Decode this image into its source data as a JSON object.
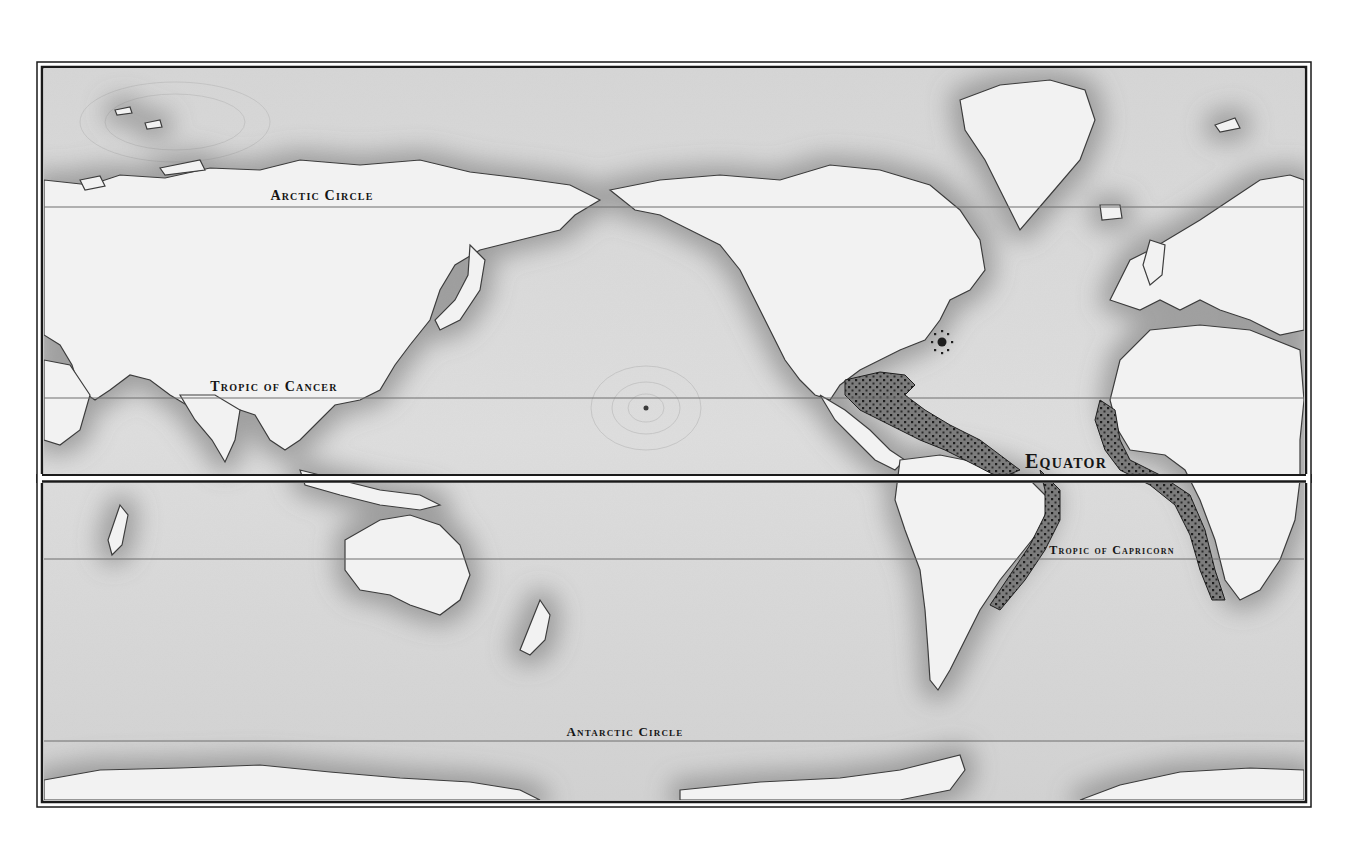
{
  "map": {
    "projection_style": "Pacific-centered world map, engraved relief style, grayscale",
    "colors": {
      "ocean": "#dcdcdc",
      "ocean_deep": "#cfcfcf",
      "land": "#f3f3f3",
      "coast_shadow": "#8a8a8a",
      "frame": "#1a1a1a",
      "latitude_line": "#7a7a7a",
      "stipple": "#2a2a2a",
      "label": "#151515"
    },
    "labels": {
      "arctic_circle": "Arctic Circle",
      "tropic_of_cancer": "Tropic of Cancer",
      "equator": "Equator",
      "tropic_of_capricorn": "Tropic of Capricorn",
      "antarctic_circle": "Antarctic Circle"
    },
    "latitude_lines": [
      {
        "name": "Arctic Circle",
        "latitude": "66.5°N"
      },
      {
        "name": "Tropic of Cancer",
        "latitude": "23.5°N"
      },
      {
        "name": "Equator",
        "latitude": "0°"
      },
      {
        "name": "Tropic of Capricorn",
        "latitude": "23.5°S"
      },
      {
        "name": "Antarctic Circle",
        "latitude": "66.5°S"
      }
    ],
    "markers": [
      {
        "name": "star-marker",
        "location": "western North Atlantic, near Bermuda"
      },
      {
        "name": "pacific-point-marker",
        "location": "central North Pacific, near Hawaii"
      }
    ],
    "stippled_regions": [
      "Caribbean Sea / Gulf of Mexico",
      "South American Atlantic coast",
      "West African coast"
    ]
  }
}
